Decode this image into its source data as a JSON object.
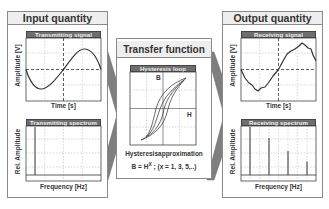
{
  "input": {
    "title": "Input quantity",
    "signal_plot": {
      "title": "Transmitting signal",
      "ylabel": "Amplitude [V]",
      "xlabel": "Time [s]",
      "waveform": "sine"
    },
    "spectrum_plot": {
      "title": "Transmitting spectrum",
      "ylabel": "Rel. Amplitude",
      "xlabel": "Frequency [Hz]",
      "lines": [
        1.0
      ]
    }
  },
  "transfer": {
    "title": "Transfer function",
    "loop_plot": {
      "title": "Hysteresis loop",
      "ylabel": "B",
      "xlabel": "H"
    },
    "approx_title": "Hysteresisapproximation",
    "formula_base": "B = H",
    "formula_exp": "X",
    "formula_rest": " ; (x = 1, 3, 5,..)"
  },
  "output": {
    "title": "Output quantity",
    "signal_plot": {
      "title": "Receiving signal",
      "ylabel": "Amplitude [V]",
      "xlabel": "Time [s]",
      "waveform": "distorted-sine"
    },
    "spectrum_plot": {
      "title": "Receiving spectrum",
      "ylabel": "Rel. Amplitude",
      "xlabel": "Frequency [Hz]",
      "lines": [
        1.0,
        0.77,
        0.5,
        0.28
      ]
    }
  },
  "colors": {
    "panel_border": "#8a8a8a",
    "header_bg": "#eeeeee",
    "plot_title_bg": "#6e6e6e",
    "arrow": "#7a7a7a",
    "curve": "#333333"
  }
}
